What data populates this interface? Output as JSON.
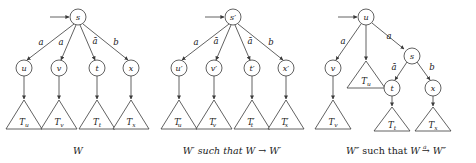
{
  "figure": {
    "background": "#ffffff",
    "ink": "#3a3a3a"
  },
  "panels": [
    {
      "id": "panel-w",
      "caption": "W",
      "caption_parts": [
        {
          "text": "W",
          "style": "italic"
        }
      ],
      "root": "s",
      "has_incoming_arrow": true,
      "edge_labels": [
        "a",
        "a",
        "ā",
        "b"
      ],
      "children": [
        "u",
        "v",
        "t",
        "x"
      ],
      "subtrees": [
        {
          "base": "T",
          "sub": "u",
          "prime": ""
        },
        {
          "base": "T",
          "sub": "v",
          "prime": ""
        },
        {
          "base": "T",
          "sub": "t",
          "prime": ""
        },
        {
          "base": "T",
          "sub": "x",
          "prime": ""
        }
      ]
    },
    {
      "id": "panel-w-prime",
      "caption": "W′ such that W → W′",
      "caption_parts": [
        {
          "text": "W′",
          "style": "italic"
        },
        {
          "text": " such that ",
          "style": "roman"
        },
        {
          "text": "W",
          "style": "italic"
        },
        {
          "text": " → ",
          "style": "roman"
        },
        {
          "text": "W′",
          "style": "italic"
        }
      ],
      "root": "s′",
      "has_incoming_arrow": true,
      "edge_labels": [
        "a",
        "ā",
        "ā",
        "b"
      ],
      "children": [
        "u′",
        "v′",
        "t′",
        "x′"
      ],
      "subtrees": [
        {
          "base": "T",
          "sub": "u",
          "prime": "′"
        },
        {
          "base": "T",
          "sub": "v",
          "prime": "′"
        },
        {
          "base": "T",
          "sub": "t",
          "prime": "′"
        },
        {
          "base": "T",
          "sub": "x",
          "prime": "′"
        }
      ]
    },
    {
      "id": "panel-w-double-prime",
      "caption": "W″ such that W →a W″",
      "caption_parts": [
        {
          "text": "W″",
          "style": "italic"
        },
        {
          "text": " such that ",
          "style": "roman"
        },
        {
          "text": "W",
          "style": "italic"
        },
        {
          "text": " → ",
          "style": "roman",
          "over": "a"
        },
        {
          "text": "W″",
          "style": "italic"
        }
      ],
      "arrow_superscript": "a",
      "root": "u",
      "has_incoming_arrow": true,
      "root_edges": [
        {
          "label": "a",
          "target": "v"
        },
        {
          "label": "",
          "target": "T_u"
        },
        {
          "label": "a",
          "target": "s"
        }
      ],
      "inner_node": "s",
      "inner_edges": [
        {
          "label": "ā",
          "target": "t"
        },
        {
          "label": "b",
          "target": "x"
        }
      ],
      "subtrees": [
        {
          "base": "T",
          "sub": "v",
          "prime": ""
        },
        {
          "base": "T",
          "sub": "u",
          "prime": ""
        },
        {
          "base": "T",
          "sub": "t",
          "prime": ""
        },
        {
          "base": "T",
          "sub": "x",
          "prime": ""
        }
      ]
    }
  ]
}
